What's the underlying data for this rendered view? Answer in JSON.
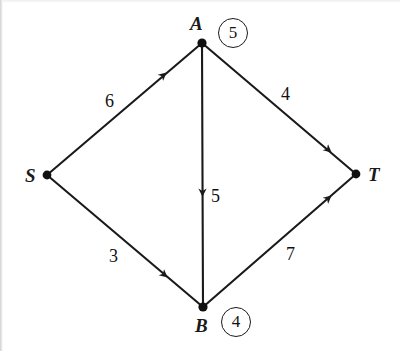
{
  "figure": {
    "kind": "flow-network-diagram",
    "background_color": "#ffffff",
    "stroke_color": "#1a1a1a",
    "width": 400,
    "height": 351
  },
  "nodes": [
    {
      "id": "S",
      "label": "S",
      "x": 47,
      "y": 175,
      "label_x": 25,
      "label_y": 166
    },
    {
      "id": "A",
      "label": "A",
      "x": 202,
      "y": 43,
      "label_x": 190,
      "label_y": 14
    },
    {
      "id": "B",
      "label": "B",
      "x": 203,
      "y": 307,
      "label_x": 195,
      "label_y": 316
    },
    {
      "id": "T",
      "label": "T",
      "x": 356,
      "y": 174,
      "label_x": 368,
      "label_y": 165
    }
  ],
  "edges": [
    {
      "id": "S-A",
      "from": "S",
      "to": "A",
      "weight": "6",
      "label_x": 105,
      "label_y": 92
    },
    {
      "id": "A-T",
      "from": "A",
      "to": "T",
      "weight": "4",
      "label_x": 281,
      "label_y": 85
    },
    {
      "id": "S-B",
      "from": "S",
      "to": "B",
      "weight": "3",
      "label_x": 109,
      "label_y": 247
    },
    {
      "id": "B-T",
      "from": "B",
      "to": "T",
      "weight": "7",
      "label_x": 286,
      "label_y": 245
    },
    {
      "id": "A-B",
      "from": "A",
      "to": "B",
      "weight": "5",
      "label_x": 211,
      "label_y": 187
    }
  ],
  "badges": [
    {
      "id": "badge-A",
      "value": "5",
      "x": 218,
      "y": 18
    },
    {
      "id": "badge-B",
      "value": "4",
      "x": 221,
      "y": 307
    }
  ]
}
